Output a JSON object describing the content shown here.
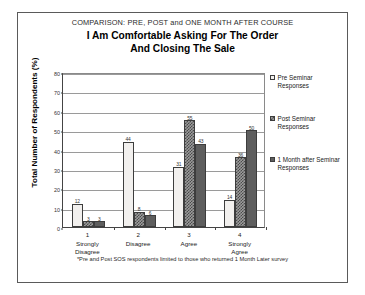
{
  "titles": {
    "supertitle": "COMPARISON: PRE,  POST and ONE MONTH AFTER COURSE",
    "line1": "I Am Comfortable Asking For The Order",
    "line2": "And Closing The Sale"
  },
  "axis": {
    "ylabel": "Total Number of Respondents (%)"
  },
  "legend": {
    "items": [
      {
        "label": "Pre Seminar Responses",
        "swatch": "white-square-icon",
        "color": "#f2f0ee"
      },
      {
        "label": "Post Seminar Responses",
        "swatch": "hatched-square-icon",
        "color": "#9b9b9b"
      },
      {
        "label": "1 Month after Seminar Responses",
        "swatch": "black-square-icon",
        "color": "#5e5e5e"
      }
    ]
  },
  "footnote": "*Pre and Post SOS respondents limited to those who returned 1 Month Later survey",
  "chart_data": {
    "type": "bar",
    "title": "I Am Comfortable Asking For The Order And Closing The Sale",
    "subtitle": "COMPARISON: PRE,  POST and ONE MONTH AFTER COURSE",
    "xlabel": "",
    "ylabel": "Total Number of Respondents (%)",
    "ylim": [
      0,
      80
    ],
    "yticks": [
      0,
      10,
      20,
      30,
      40,
      50,
      60,
      70,
      80
    ],
    "grid": true,
    "legend_position": "right",
    "categories": [
      "1\nStrongly Disagree",
      "2\nDisagree",
      "3\nAgree",
      "4\nStrongly Agree"
    ],
    "category_numbers": [
      "1",
      "2",
      "3",
      "4"
    ],
    "category_lines": [
      [
        "Strongly",
        "Disagree"
      ],
      [
        "Disagree"
      ],
      [
        "Agree"
      ],
      [
        "Strongly",
        "Agree"
      ]
    ],
    "series": [
      {
        "name": "Pre Seminar Responses",
        "values": [
          12,
          44,
          31,
          14
        ]
      },
      {
        "name": "Post Seminar Responses",
        "values": [
          3,
          8,
          55,
          36
        ]
      },
      {
        "name": "1 Month after Seminar Responses",
        "values": [
          3,
          6,
          43,
          50
        ]
      }
    ]
  }
}
